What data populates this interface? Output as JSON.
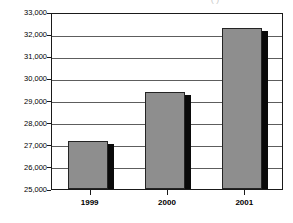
{
  "chart_data": {
    "type": "bar",
    "title": "",
    "title_sliver_text": "( )",
    "xlabel": "",
    "ylabel": "",
    "categories": [
      "1999",
      "2000",
      "2001"
    ],
    "values": [
      27150,
      29380,
      32280
    ],
    "series": [
      {
        "name": "Series 1",
        "values": [
          27150,
          29380,
          32280
        ]
      }
    ],
    "ylim": [
      25000,
      33000
    ],
    "ytick_values": [
      25000,
      26000,
      27000,
      28000,
      29000,
      30000,
      31000,
      32000,
      33000
    ],
    "ytick_labels": [
      "25,000",
      "26,000",
      "27,000",
      "28,000",
      "29,000",
      "30,000",
      "31,000",
      "32,000",
      "33,000"
    ],
    "grid": true,
    "grid_axis": "y",
    "legend": false,
    "legend_position": "none",
    "bar_style": "3d-shadow",
    "colors": {
      "bar_fill": "#8e8e8e",
      "bar_shadow": "#0a0a0a",
      "bar_outline": "#242424",
      "gridline": "#5d5d5d",
      "frame": "#1a1a1a",
      "text": "#000000",
      "background": "#ffffff"
    }
  }
}
